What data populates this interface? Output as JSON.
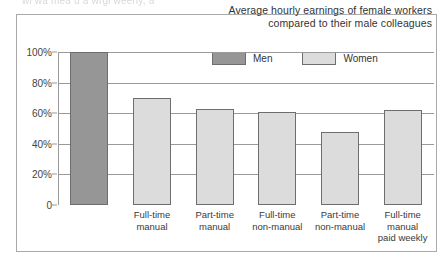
{
  "top_fragment": "wi wa mea u a wrgi weeny, a",
  "chart_data": {
    "type": "bar",
    "title": "Average hourly earnings of female workers compared to their male colleagues",
    "title_line1": "Average hourly earnings of female workers",
    "title_line2": "compared to their male colleagues",
    "xlabel": "",
    "ylabel": "",
    "ylim": [
      0,
      100
    ],
    "grid": true,
    "legend_position": "top-right",
    "legend": [
      {
        "label": "Men",
        "color": "#969696"
      },
      {
        "label": "Women",
        "color": "#dcdcdc"
      }
    ],
    "ytick_labels": [
      "100%",
      "80%",
      "60%",
      "40%",
      "20%",
      "0"
    ],
    "ytick_values": [
      100,
      80,
      60,
      40,
      20,
      0
    ],
    "categories": [
      "Men",
      "Full-time manual",
      "Part-time manual",
      "Full-time non-manual",
      "Part-time non-manual",
      "Full-time manual paid weekly"
    ],
    "category_lines": [
      [
        ""
      ],
      [
        "Full-time",
        "manual"
      ],
      [
        "Part-time",
        "manual"
      ],
      [
        "Full-time",
        "non-manual"
      ],
      [
        "Part-time",
        "non-manual"
      ],
      [
        "Full-time",
        "manual",
        "paid weekly"
      ]
    ],
    "values": [
      100,
      70,
      63,
      61,
      48,
      62
    ],
    "series_of_bar": [
      "Men",
      "Women",
      "Women",
      "Women",
      "Women",
      "Women"
    ]
  }
}
